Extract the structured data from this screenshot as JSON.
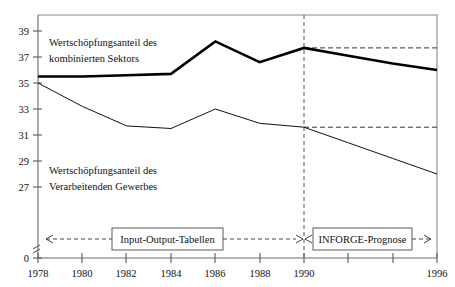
{
  "chart_data": {
    "type": "line",
    "title": "",
    "xlabel": "",
    "ylabel": "",
    "x": [
      1978,
      1980,
      1982,
      1984,
      1986,
      1988,
      1990,
      1992,
      1994,
      1996
    ],
    "xlim": [
      1978,
      1996
    ],
    "ylim": [
      26,
      40
    ],
    "grid": false,
    "legend_position": "inline-annotation",
    "y_axis_break": true,
    "y_zero_label": "0",
    "x_tick_labels": [
      "1978",
      "1980",
      "1982",
      "1984",
      "1986",
      "1988",
      "1990",
      "",
      "",
      "1996"
    ],
    "y_tick_labels": [
      "27",
      "29",
      "31",
      "33",
      "35",
      "37",
      "39"
    ],
    "y_ticks": [
      27,
      29,
      31,
      33,
      35,
      37,
      39
    ],
    "series": [
      {
        "name": "Wertschöpfungsanteil des kombinierten Sektors",
        "style": "thick",
        "values": [
          35.5,
          35.5,
          35.6,
          35.7,
          38.2,
          36.6,
          37.7,
          37.1,
          36.5,
          36.0
        ]
      },
      {
        "name": "Wertschöpfungsanteil des Verarbeitenden Gewerbes",
        "style": "thin",
        "values": [
          35.0,
          33.2,
          31.7,
          31.5,
          33.0,
          31.9,
          31.6,
          30.4,
          29.2,
          28.0
        ]
      }
    ],
    "reference_lines": [
      {
        "name": "kombinierter-sektor-1990-level",
        "y": 37.7,
        "from_x": 1990,
        "to_x": 1996,
        "style": "dashed"
      },
      {
        "name": "verarbeitendes-gewerbe-1990-level",
        "y": 31.6,
        "from_x": 1990,
        "to_x": 1996,
        "style": "dashed"
      }
    ],
    "divider": {
      "name": "forecast-divider",
      "x": 1990,
      "style": "dashed-vertical"
    },
    "annotations": [
      {
        "name": "series-label-kombiniert",
        "line1": "Wertschöpfungsanteil des",
        "line2": "kombinierten Sektors",
        "x": 1979.0,
        "y": 38.6
      },
      {
        "name": "series-label-verarbeitend",
        "line1": "Wertschöpfungsanteil des",
        "line2": "Verarbeitenden Gewerbes",
        "x": 1979.0,
        "y": 30.2
      }
    ],
    "period_boxes": [
      {
        "name": "period-box-historic",
        "label": "Input-Output-Tabellen",
        "from_x": 1978,
        "to_x": 1990
      },
      {
        "name": "period-box-forecast",
        "label": "INFORGE-Prognose",
        "from_x": 1990,
        "to_x": 1996
      }
    ]
  },
  "labels": {
    "series_kombiniert_line1": "Wertschöpfungsanteil des",
    "series_kombiniert_line2": "kombinierten Sektors",
    "series_verarbeitend_line1": "Wertschöpfungsanteil des",
    "series_verarbeitend_line2": "Verarbeitenden Gewerbes",
    "box_historic": "Input-Output-Tabellen",
    "box_forecast": "INFORGE-Prognose"
  },
  "axis": {
    "y_zero": "0",
    "y_27": "27",
    "y_29": "29",
    "y_31": "31",
    "y_33": "33",
    "y_35": "35",
    "y_37": "37",
    "y_39": "39",
    "x_1978": "1978",
    "x_1980": "1980",
    "x_1982": "1982",
    "x_1984": "1984",
    "x_1986": "1986",
    "x_1988": "1988",
    "x_1990": "1990",
    "x_1996": "1996"
  },
  "colors": {
    "series_thick": "#000000",
    "series_thin": "#111111",
    "axis": "#6b6b6b",
    "background": "#ffffff"
  }
}
